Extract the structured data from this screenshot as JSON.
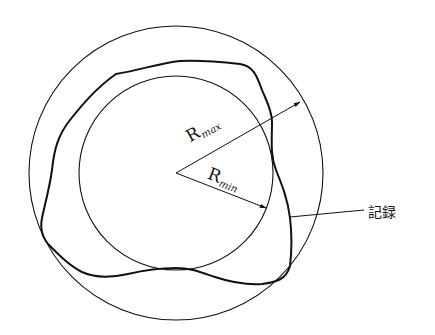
{
  "diagram": {
    "title": "",
    "labels": {
      "r_max": {
        "main": "R",
        "sub": "max"
      },
      "r_min": {
        "main": "R",
        "sub": "min"
      },
      "record": "記録"
    },
    "geometry": {
      "center": [
        176,
        173
      ],
      "outer_radius": 147,
      "inner_radius": 97
    },
    "colors": {
      "line": "#111111",
      "background": "#ffffff"
    }
  }
}
